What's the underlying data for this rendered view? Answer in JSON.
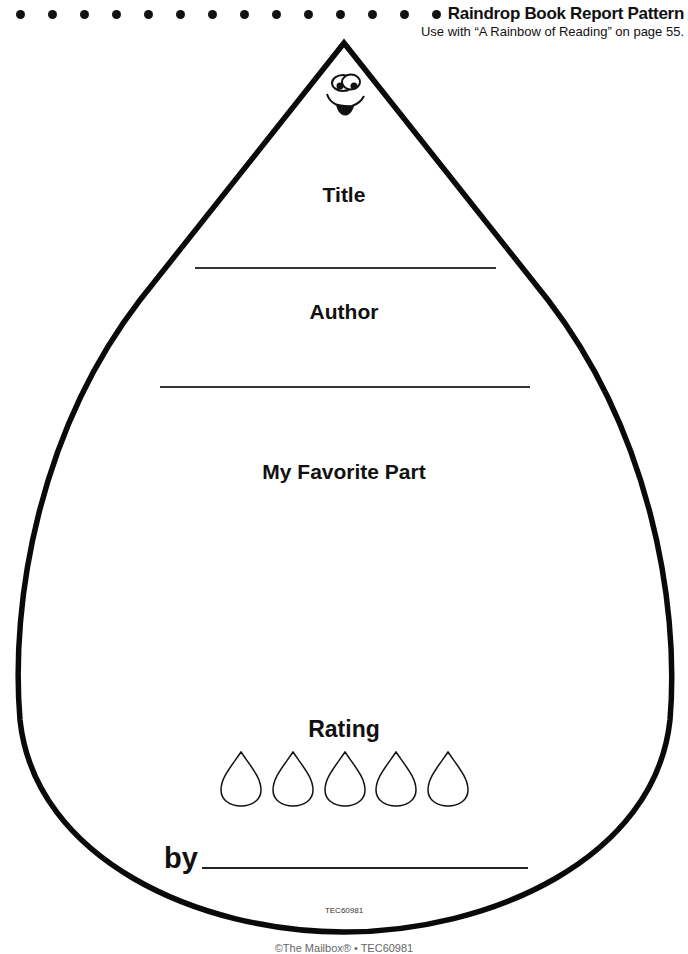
{
  "header": {
    "title": "Raindrop Book Report Pattern",
    "subtitle": "Use with “A Rainbow of Reading” on page 55.",
    "dot_count": 14
  },
  "form": {
    "sections": [
      {
        "label": "Title",
        "has_line": true
      },
      {
        "label": "Author",
        "has_line": true
      },
      {
        "label": "My Favorite Part",
        "has_line": false
      },
      {
        "label": "Rating",
        "has_line": false
      }
    ],
    "rating_drops": 5,
    "by_label": "by"
  },
  "product_code": "TEC60981",
  "footer_clipped": "©The Mailbox® • TEC60981"
}
